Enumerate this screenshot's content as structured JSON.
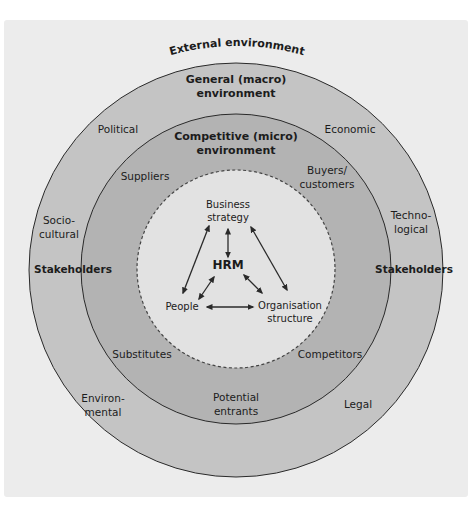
{
  "diagram": {
    "title": "External environment",
    "colors": {
      "background": "#ececec",
      "outer_ring": "#c4c4c4",
      "middle_ring": "#b3b3b3",
      "inner_circle": "#e2e2e2",
      "stroke": "#2a2a2a"
    },
    "rings": {
      "outer": {
        "heading": "General (macro) environment",
        "heading_line1": "General (macro)",
        "heading_line2": "environment",
        "factors": {
          "political": "Political",
          "economic": "Economic",
          "socio_line1": "Socio-",
          "socio_line2": "cultural",
          "techno_line1": "Techno-",
          "techno_line2": "logical",
          "environ_line1": "Environ-",
          "environ_line2": "mental",
          "legal": "Legal"
        },
        "stakeholders_left": "Stakeholders",
        "stakeholders_right": "Stakeholders"
      },
      "middle": {
        "heading_line1": "Competitive (micro)",
        "heading_line2": "environment",
        "forces": {
          "suppliers": "Suppliers",
          "buyers_line1": "Buyers/",
          "buyers_line2": "customers",
          "substitutes": "Substitutes",
          "competitors": "Competitors",
          "entrants_line1": "Potential",
          "entrants_line2": "entrants"
        }
      },
      "inner": {
        "center": "HRM",
        "nodes": {
          "strategy_line1": "Business",
          "strategy_line2": "strategy",
          "people": "People",
          "org_line1": "Organisation",
          "org_line2": "structure"
        }
      }
    },
    "relationships": [
      {
        "from": "Business strategy",
        "to": "People",
        "type": "two-way"
      },
      {
        "from": "Business strategy",
        "to": "HRM",
        "type": "two-way"
      },
      {
        "from": "Business strategy",
        "to": "Organisation structure",
        "type": "two-way"
      },
      {
        "from": "HRM",
        "to": "People",
        "type": "two-way"
      },
      {
        "from": "HRM",
        "to": "Organisation structure",
        "type": "two-way"
      },
      {
        "from": "People",
        "to": "Organisation structure",
        "type": "two-way"
      }
    ]
  }
}
